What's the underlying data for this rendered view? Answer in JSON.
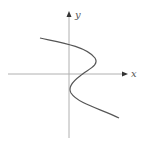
{
  "diagram": {
    "axes": {
      "x_label": "x",
      "y_label": "y"
    },
    "curve": {
      "description": "S-shaped curve, x as a function of y (cubic-like)",
      "color": "#555555"
    },
    "colors": {
      "axis": "#aaaaaa",
      "arrow": "#333333",
      "curve": "#555555"
    }
  }
}
